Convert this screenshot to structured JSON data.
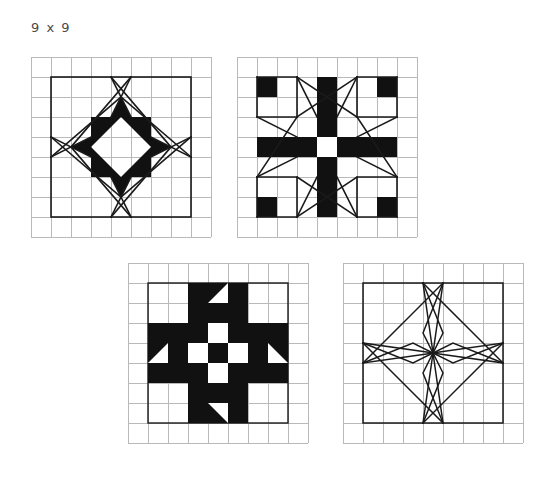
{
  "sheet": {
    "label": "9 x 9",
    "grid_size": 9,
    "cell_px": 20,
    "colors": {
      "background": "#ffffff",
      "grid_line": "#b9b9b9",
      "ink": "#1a1a1a",
      "fill": "#111111",
      "label_text": "#4a4a4a"
    }
  },
  "blocks": [
    {
      "id": "block-1",
      "name": "eight-pointed-star-outline",
      "position": {
        "x": 31,
        "y": 57
      },
      "grid": 9,
      "style": "outline-star-with-filled-center-diamond",
      "border_inset_cells": 1,
      "center": {
        "col": 4,
        "row": 4
      },
      "filled_cells": 12,
      "line_count": 16
    },
    {
      "id": "block-2",
      "name": "solid-cross-with-radiating-diagonals",
      "position": {
        "x": 237,
        "y": 57
      },
      "grid": 9,
      "style": "filled-cross-star",
      "border_inset_cells": 1,
      "center": {
        "col": 4,
        "row": 4
      },
      "center_cell_color": "#ffffff",
      "arm_width_cells": 1,
      "line_count": 8
    },
    {
      "id": "block-3",
      "name": "checkerboard-cross-with-forked-arms",
      "position": {
        "x": 128,
        "y": 263
      },
      "grid": 9,
      "style": "filled-checkerboard-star",
      "border_inset_cells": 1,
      "center": {
        "col": 4,
        "row": 4
      },
      "checker_size_cells": 3,
      "arm_width_cells": 1
    },
    {
      "id": "block-4",
      "name": "line-drawing-star-skeleton",
      "position": {
        "x": 343,
        "y": 263
      },
      "grid": 9,
      "style": "outline-only-star",
      "border_inset_cells": 1,
      "center": {
        "col": 4,
        "row": 4
      },
      "line_count": 20
    }
  ]
}
